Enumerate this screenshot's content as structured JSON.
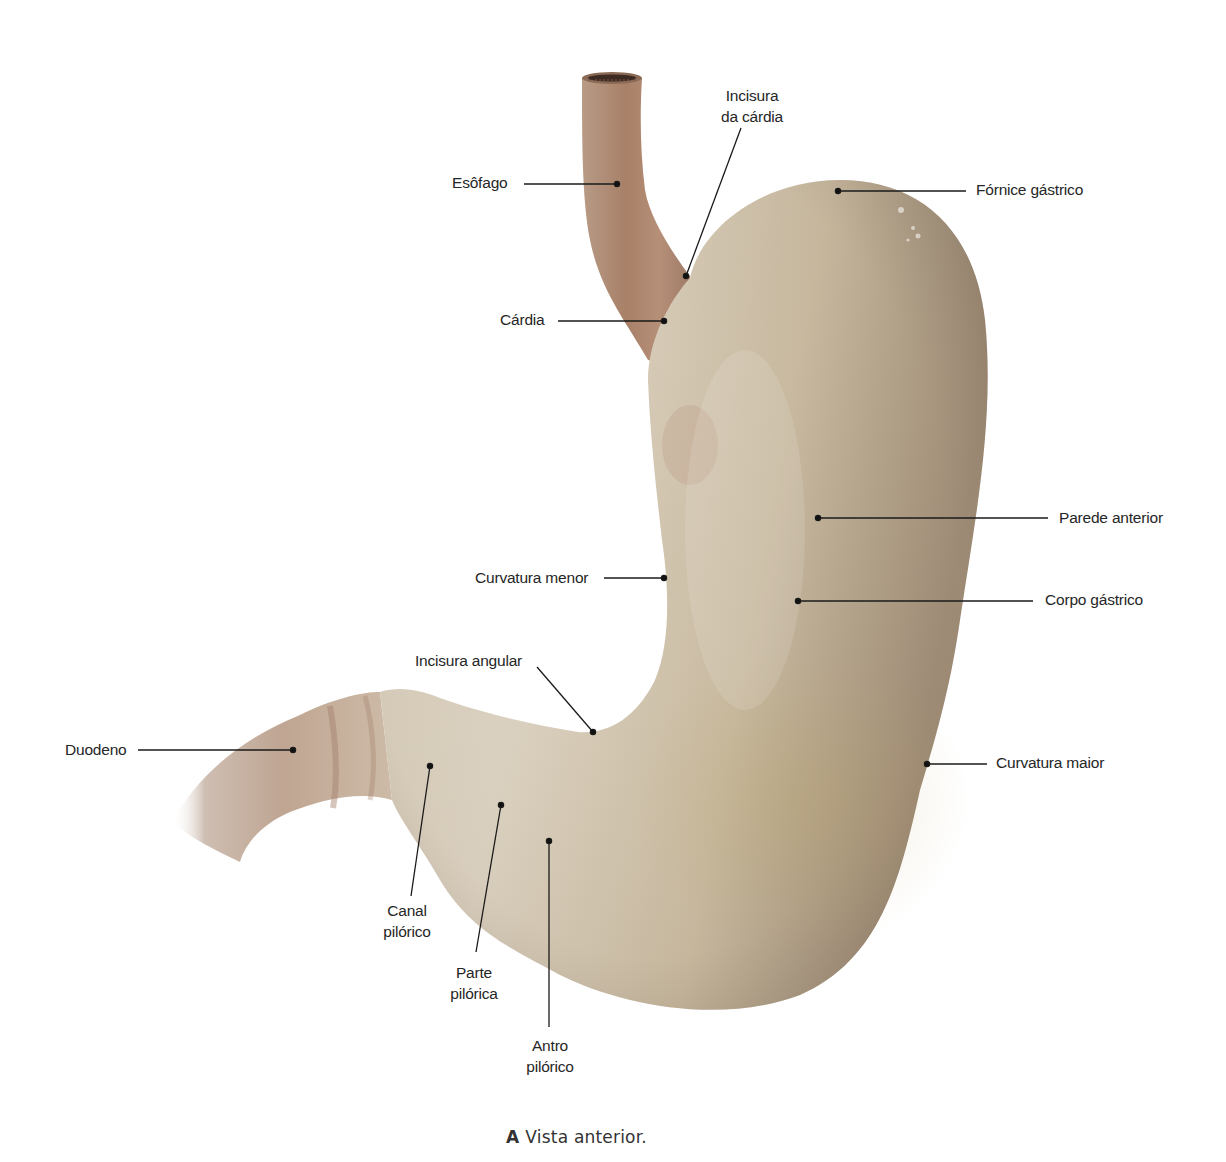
{
  "figure": {
    "caption_letter": "A",
    "caption_text": "Vista anterior.",
    "colors": {
      "background": "#ffffff",
      "stomach_light": "#d9cfbd",
      "stomach_mid": "#c3b49c",
      "stomach_dark": "#9c8a73",
      "esophagus": "#b08c74",
      "leader_line": "#1a1a1a"
    }
  },
  "labels": {
    "esofago": "Esôfago",
    "incisura_cardia_1": "Incisura",
    "incisura_cardia_2": "da cárdia",
    "fornice": "Fórnice gástrico",
    "cardia": "Cárdia",
    "parede_anterior": "Parede anterior",
    "curvatura_menor": "Curvatura menor",
    "corpo_gastrico": "Corpo gástrico",
    "incisura_angular": "Incisura angular",
    "duodeno": "Duodeno",
    "curvatura_maior": "Curvatura maior",
    "canal_pilorico_1": "Canal",
    "canal_pilorico_2": "pilórico",
    "parte_pilorica_1": "Parte",
    "parte_pilorica_2": "pilórica",
    "antro_pilorico_1": "Antro",
    "antro_pilorico_2": "pilórico"
  }
}
